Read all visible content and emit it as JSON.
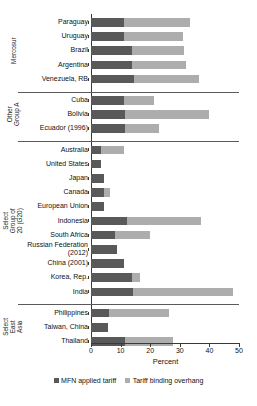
{
  "chart_data": {
    "type": "bar",
    "orientation": "horizontal",
    "stacked": true,
    "title": "",
    "xlabel": "Percent",
    "ylabel": "",
    "xlim": [
      0,
      50
    ],
    "xticks": [
      0,
      10,
      20,
      30,
      40,
      50
    ],
    "grid": false,
    "legend_position": "bottom",
    "series": [
      {
        "name": "MFN applied tariff",
        "color": "#595959"
      },
      {
        "name": "Tariff binding overhang",
        "color": "#adadad"
      }
    ],
    "groups": [
      {
        "name": "Mercosur",
        "label_lines": "Mercosur",
        "categories": [
          {
            "label": "Paraguay",
            "applied": 11.0,
            "overhang": 22.5
          },
          {
            "label": "Uruguay",
            "applied": 11.0,
            "overhang": 20.1
          },
          {
            "label": "Brazil",
            "applied": 13.7,
            "overhang": 17.8
          },
          {
            "label": "Argentina",
            "applied": 13.7,
            "overhang": 18.5
          },
          {
            "label": "Venezuela, RB",
            "applied": 14.4,
            "overhang": 22.2
          }
        ]
      },
      {
        "name": "Other Group A",
        "label_lines": "Other Group A",
        "categories": [
          {
            "label": "Cuba",
            "applied": 11.3,
            "overhang": 9.9
          },
          {
            "label": "Bolivia",
            "applied": 11.6,
            "overhang": 28.4
          },
          {
            "label": "Ecuador (1996)",
            "applied": 11.6,
            "overhang": 11.4
          }
        ]
      },
      {
        "name": "Select Group of 20 (G20)",
        "label_lines": "Select Group of 20 (G20)",
        "categories": [
          {
            "label": "Australia",
            "applied": 3.5,
            "overhang": 7.5
          },
          {
            "label": "United States",
            "applied": 3.5,
            "overhang": 0.0
          },
          {
            "label": "Japan",
            "applied": 4.5,
            "overhang": 0.0
          },
          {
            "label": "Canada",
            "applied": 4.5,
            "overhang": 2.0
          },
          {
            "label": "European Union",
            "applied": 4.5,
            "overhang": 0.0
          },
          {
            "label": "Indonesia",
            "applied": 12.0,
            "overhang": 25.0
          },
          {
            "label": "South Africa",
            "applied": 8.0,
            "overhang": 12.0
          },
          {
            "label": "Russian Federation (2012)",
            "applied": 8.8,
            "overhang": 0.0
          },
          {
            "label": "China (2001)",
            "applied": 11.0,
            "overhang": 0.0
          },
          {
            "label": "Korea, Rep.",
            "applied": 13.7,
            "overhang": 2.7
          },
          {
            "label": "India",
            "applied": 14.3,
            "overhang": 33.7
          }
        ]
      },
      {
        "name": "Select East Asia",
        "label_lines": "Select East Asia",
        "categories": [
          {
            "label": "Philippines",
            "applied": 6.2,
            "overhang": 20.2
          },
          {
            "label": "Taiwan, China",
            "applied": 5.9,
            "overhang": 0.0
          },
          {
            "label": "Thailand",
            "applied": 11.6,
            "overhang": 16.1
          }
        ]
      }
    ]
  },
  "legend": {
    "items": [
      {
        "label": "MFN applied tariff",
        "swatch": "applied"
      },
      {
        "label": "Tariff binding overhang",
        "swatch": "overhang"
      }
    ]
  },
  "axis": {
    "x_title": "Percent",
    "tick_labels": [
      "0",
      "10",
      "20",
      "30",
      "40",
      "50"
    ]
  },
  "group_rail_labels": [
    "Mercosur",
    "Other Group A",
    "Select Group of 20 (G20)",
    "Select East Asia"
  ]
}
